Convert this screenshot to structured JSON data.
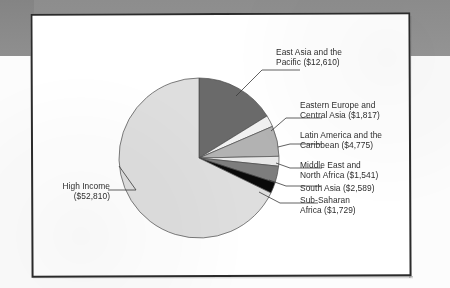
{
  "figure": {
    "background_band_color": "#8f8f8f",
    "frame_border_color": "#2b2b2b",
    "page_color": "#ffffff"
  },
  "chart_data": {
    "type": "pie",
    "title": "",
    "subtitle": "",
    "xlabel": "",
    "ylabel": "",
    "units": "US dollars",
    "total": 77871,
    "legend_position": "callout-labels",
    "grid": false,
    "categories": [
      "East Asia and the Pacific",
      "Eastern Europe and Central Asia",
      "Latin America and the Caribbean",
      "Middle East and North Africa",
      "South Asia",
      "Sub-Saharan Africa",
      "High Income"
    ],
    "values": [
      12610,
      1817,
      4775,
      1541,
      2589,
      1729,
      52810
    ],
    "value_labels": [
      "$12,610",
      "$1,817",
      "$4,775",
      "$1,541",
      "$2,589",
      "$1,729",
      "$52,810"
    ],
    "colors": [
      "#6a6a6a",
      "#f0f0f0",
      "#b2b2b2",
      "#e8e8e8",
      "#7d7d7d",
      "#0a0a0a",
      "#dedede"
    ],
    "start_angle_deg": 0,
    "direction": "clockwise",
    "slice_angles_deg": [
      58.3,
      8.4,
      22.1,
      7.1,
      12.0,
      8.0,
      244.1
    ],
    "slices": [
      {
        "name": "East Asia and the Pacific",
        "value": 12610,
        "label": "$12,610",
        "color": "#6a6a6a",
        "angle_deg": 58.3,
        "percent": 16.2
      },
      {
        "name": "Eastern Europe and Central Asia",
        "value": 1817,
        "label": "$1,817",
        "color": "#f0f0f0",
        "angle_deg": 8.4,
        "percent": 2.3
      },
      {
        "name": "Latin America and the Caribbean",
        "value": 4775,
        "label": "$4,775",
        "color": "#b2b2b2",
        "angle_deg": 22.1,
        "percent": 6.1
      },
      {
        "name": "Middle East and North Africa",
        "value": 1541,
        "label": "$1,541",
        "color": "#e8e8e8",
        "angle_deg": 7.1,
        "percent": 2.0
      },
      {
        "name": "South Asia",
        "value": 2589,
        "label": "$2,589",
        "color": "#7d7d7d",
        "angle_deg": 12.0,
        "percent": 3.3
      },
      {
        "name": "Sub-Saharan Africa",
        "value": 1729,
        "label": "$1,729",
        "color": "#0a0a0a",
        "angle_deg": 8.0,
        "percent": 2.2
      },
      {
        "name": "High Income",
        "value": 52810,
        "label": "$52,810",
        "color": "#dedede",
        "angle_deg": 244.1,
        "percent": 67.8
      }
    ]
  },
  "labels": {
    "east_asia": "East Asia and the\nPacific ($12,610)",
    "eastern_europe": "Eastern Europe and\nCentral Asia ($1,817)",
    "latin_america": "Latin America and the\nCaribbean ($4,775)",
    "middle_east": "Middle East and\nNorth Africa ($1,541)",
    "south_asia": "South Asia ($2,589)",
    "sub_saharan": "Sub-Saharan\nAfrica ($1,729)",
    "high_income": "High Income\n($52,810)"
  }
}
